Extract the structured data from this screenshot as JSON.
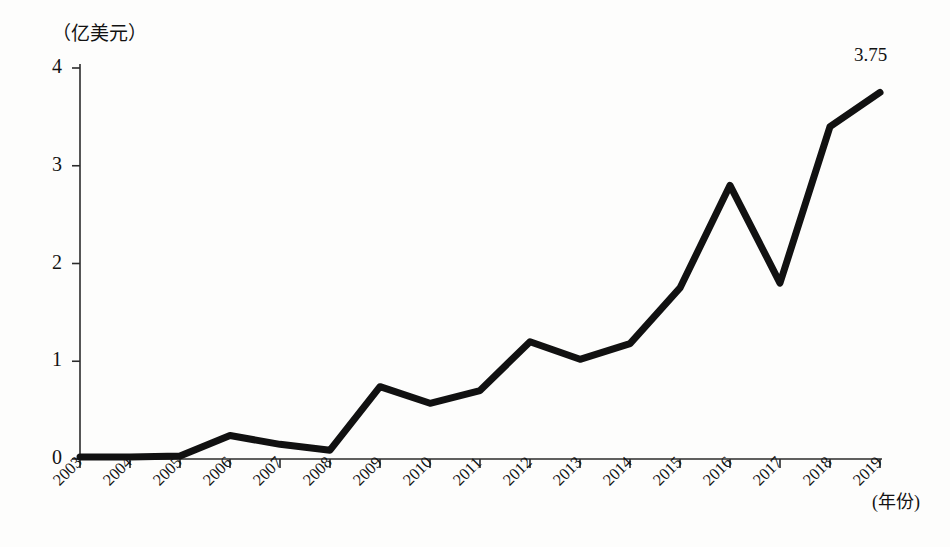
{
  "chart_data": {
    "type": "line",
    "title": "",
    "subtitle": "",
    "xlabel": "(年份)",
    "ylabel": "（亿美元）",
    "ylim": [
      0,
      4
    ],
    "yticks": [
      0,
      1,
      2,
      3,
      4
    ],
    "ytick_labels": [
      "0",
      "1",
      "2",
      "3",
      "4"
    ],
    "grid": false,
    "legend": "none",
    "categories": [
      "2003",
      "2004",
      "2005",
      "2006",
      "2007",
      "2008",
      "2009",
      "2010",
      "2011",
      "2012",
      "2013",
      "2014",
      "2015",
      "2016",
      "2017",
      "2018",
      "2019"
    ],
    "values": [
      0.02,
      0.02,
      0.03,
      0.24,
      0.15,
      0.09,
      0.74,
      0.57,
      0.7,
      1.2,
      1.02,
      1.18,
      1.75,
      2.8,
      1.8,
      3.4,
      3.75
    ],
    "annotations": [
      {
        "category": "2019",
        "value": 3.75,
        "text": "3.75"
      }
    ],
    "line_color": "#111111",
    "line_width": 7
  },
  "axis": {
    "y_unit_caption": "（亿美元）",
    "x_axis_caption": "(年份)"
  }
}
